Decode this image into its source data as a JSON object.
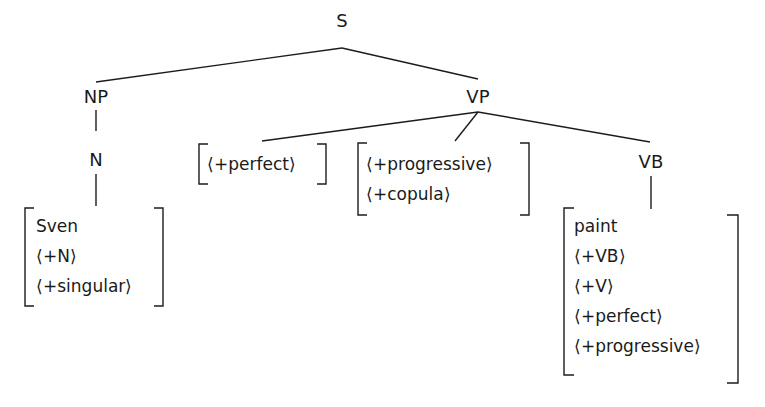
{
  "tree": {
    "root": {
      "label": "S"
    },
    "np": {
      "label": "NP"
    },
    "n": {
      "label": "N"
    },
    "vp": {
      "label": "VP"
    },
    "vb": {
      "label": "VB"
    },
    "brackets": {
      "noun_matrix": {
        "lexeme": "Sven",
        "features": [
          "+N",
          "+singular"
        ]
      },
      "perfect_matrix": {
        "features": [
          "+perfect"
        ]
      },
      "progressive_matrix": {
        "features": [
          "+progressive",
          "+copula"
        ]
      },
      "verb_matrix": {
        "lexeme": "paint",
        "features": [
          "+VB",
          "+V",
          "+perfect",
          "+progressive"
        ]
      }
    },
    "glyphs": {
      "left_angle": "⟨",
      "right_angle": "⟩",
      "plus": "+"
    }
  }
}
